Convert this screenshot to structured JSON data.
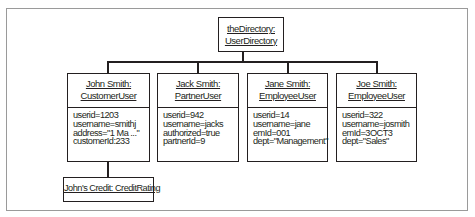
{
  "diagram": {
    "type": "UML object diagram",
    "root": {
      "name": "theDirectory:",
      "class": "UserDirectory"
    },
    "objects": [
      {
        "name": "John Smith:",
        "class": "CustomerUser",
        "attributes": [
          "userid=1203",
          "username=smithj",
          "address=\"1 Ma ...\"",
          "customerId:233"
        ]
      },
      {
        "name": "Jack Smith:",
        "class": "PartnerUser",
        "attributes": [
          "userid=942",
          "username=jacks",
          "authorized=true",
          "partnerId=9"
        ]
      },
      {
        "name": "Jane Smith:",
        "class": "EmployeeUser",
        "attributes": [
          "userid=14",
          "username=jane",
          "emId=001",
          "dept=\"Management\""
        ]
      },
      {
        "name": "Joe Smith:",
        "class": "EmployeeUser",
        "attributes": [
          "userid=322",
          "username=josmith",
          "emId=3OCT3",
          "dept=\"Sales\""
        ]
      }
    ],
    "child": {
      "label": "John's Credit: CreditRating"
    }
  }
}
